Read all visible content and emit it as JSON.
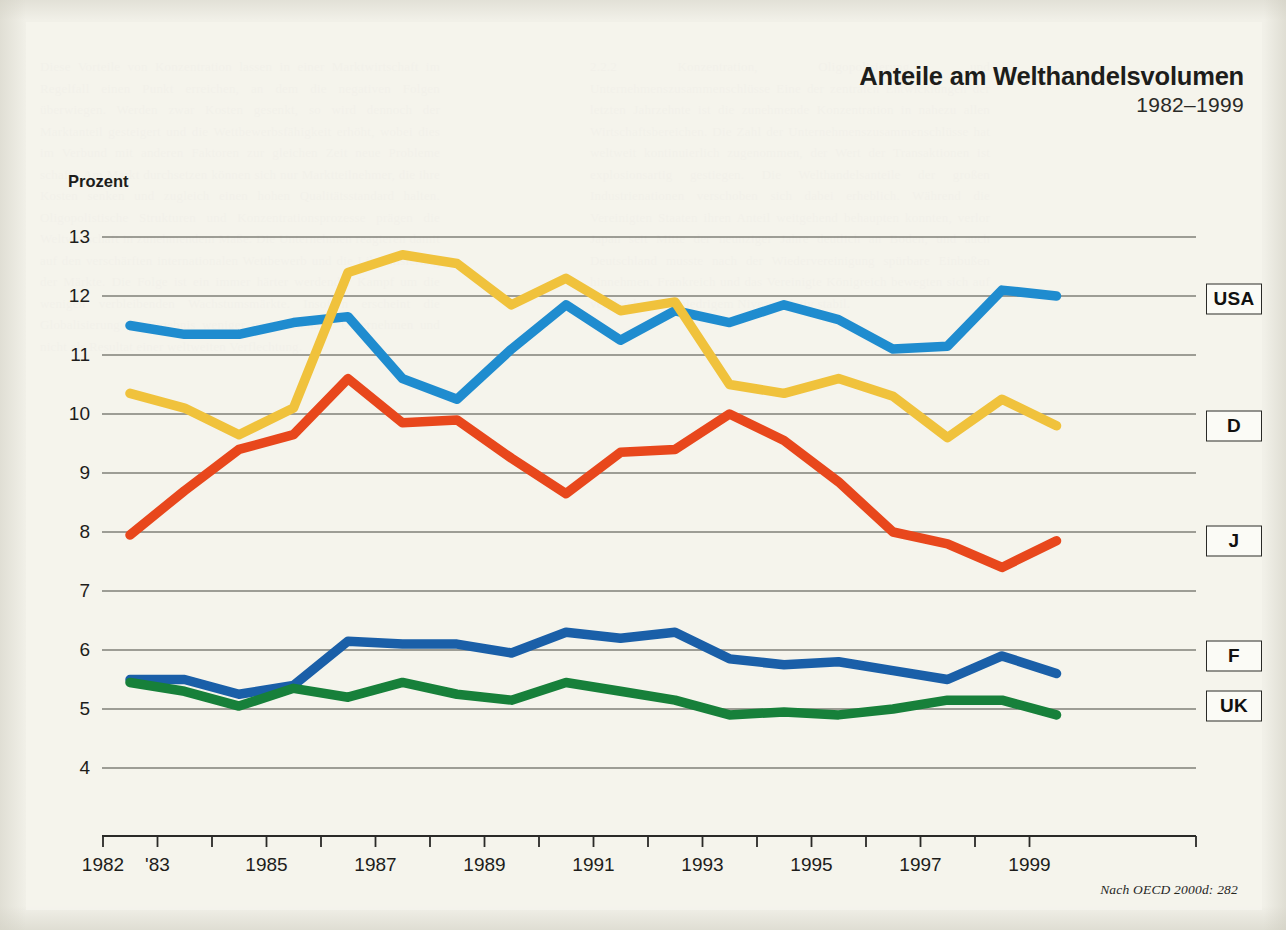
{
  "header": {
    "title": "Anteile am Welthandelsvolumen",
    "subtitle": "1982–1999"
  },
  "axis": {
    "y_title": "Prozent"
  },
  "source": {
    "note": "Nach OECD 2000d: 282"
  },
  "labels": {
    "usa": "USA",
    "d": "D",
    "j": "J",
    "f": "F",
    "uk": "UK"
  },
  "colors": {
    "usa": "#1f8ccf",
    "d": "#f0c23c",
    "j": "#e8471c",
    "f": "#1a5fa8",
    "uk": "#17803a",
    "grid": "#46463f",
    "axis": "#2a2a27",
    "paper": "#f1f0e8",
    "ink": "#1d1d1b"
  },
  "ghost": {
    "col_left": "Diese Vorteile von Konzentration lassen in einer Marktwirtschaft im Regelfall einen Punkt erreichen, an dem die negativen Folgen überwiegen. Werden zwar Kosten gesenkt, so wird dennoch der Marktanteil gesteigert und die Wettbewerbsfähigkeit erhöht, wobei dies im Verbund mit anderen Faktoren zur gleichen Zeit neue Probleme schafft. Am Markt durchsetzen können sich nur Marktteilnehmer, die ihre Kosten senken und zugleich einen hohen Qualitätsstandard halten. Oligopolistische Strukturen und Konzentrationsprozesse prägen die Weltwirtschaft in zunehmendem Maße. Die Unternehmen reagieren damit auf den verschärften internationalen Wettbewerb und die Liberalisierung der Märkte. Die Folge ist ein immer härter werdender Kampf um die wenigen verbleibenden Wachstumsmärkte. Insofern erscheint die Globalisierung als Ergebnis weniger multinationaler Unternehmen und nicht als Resultat einer weltweiten Verflechtung.",
    "col_right": "2.2.2 Konzentration, Oligopolisierung und Unternehmenszusammenschlüsse Eine der zentralen Entwicklungen der letzten Jahrzehnte ist die zunehmende Konzentration in nahezu allen Wirtschaftsbereichen. Die Zahl der Unternehmenszusammenschlüsse hat weltweit kontinuierlich zugenommen, der Wert der Transaktionen ist explosionsartig gestiegen. Die Welthandelsanteile der großen Industrienationen verschoben sich dabei erheblich. Während die Vereinigten Staaten ihren Anteil weitgehend behaupten konnten, verlor Japan seit Mitte der neunziger Jahre deutlich an Boden, und auch Deutschland musste nach der Wiedervereinigung spürbare Einbußen hinnehmen. Frankreich und das Vereinigte Königreich bewegten sich auf vergleichsweise niedrigem Niveau relativ stabil."
  },
  "chart_data": {
    "type": "line",
    "title": "Anteile am Welthandelsvolumen",
    "subtitle": "1982–1999",
    "xlabel": "",
    "ylabel": "Prozent",
    "xlim": [
      1982,
      1999
    ],
    "ylim": [
      4,
      13
    ],
    "grid": true,
    "legend_position": "right-inline",
    "x": [
      1982,
      1983,
      1984,
      1985,
      1986,
      1987,
      1988,
      1989,
      1990,
      1991,
      1992,
      1993,
      1994,
      1995,
      1996,
      1997,
      1998,
      1999
    ],
    "x_tick_labels": [
      "1982",
      "'83",
      "",
      "1985",
      "",
      "1987",
      "",
      "1989",
      "",
      "1991",
      "",
      "1993",
      "",
      "1995",
      "",
      "1997",
      "",
      "1999"
    ],
    "y_ticks": [
      4,
      5,
      6,
      7,
      8,
      9,
      10,
      11,
      12,
      13
    ],
    "series": [
      {
        "name": "USA",
        "color": "#1f8ccf",
        "values": [
          11.5,
          11.35,
          11.35,
          11.55,
          11.65,
          10.6,
          10.25,
          11.1,
          11.85,
          11.25,
          11.75,
          11.55,
          11.85,
          11.6,
          11.1,
          11.15,
          12.1,
          12.0
        ]
      },
      {
        "name": "D",
        "color": "#f0c23c",
        "values": [
          10.35,
          10.1,
          9.65,
          10.1,
          12.4,
          12.7,
          12.55,
          11.85,
          12.3,
          11.75,
          11.9,
          10.5,
          10.35,
          10.6,
          10.3,
          9.6,
          10.25,
          9.8
        ]
      },
      {
        "name": "J",
        "color": "#e8471c",
        "values": [
          7.95,
          8.7,
          9.4,
          9.65,
          10.6,
          9.85,
          9.9,
          9.25,
          8.65,
          9.35,
          9.4,
          10.0,
          9.55,
          8.85,
          8.0,
          7.8,
          7.4,
          7.85
        ]
      },
      {
        "name": "F",
        "color": "#1a5fa8",
        "values": [
          5.5,
          5.5,
          5.25,
          5.4,
          6.15,
          6.1,
          6.1,
          5.95,
          6.3,
          6.2,
          6.3,
          5.85,
          5.75,
          5.8,
          5.65,
          5.5,
          5.9,
          5.6
        ]
      },
      {
        "name": "UK",
        "color": "#17803a",
        "values": [
          5.45,
          5.3,
          5.05,
          5.35,
          5.2,
          5.45,
          5.25,
          5.15,
          5.45,
          5.3,
          5.15,
          4.9,
          4.95,
          4.9,
          5.0,
          5.15,
          5.15,
          4.9
        ]
      }
    ]
  },
  "plot_geometry": {
    "left": 102,
    "right": 1196,
    "top": 237,
    "bottom": 768,
    "x_start": 130,
    "x_step": 54.5
  }
}
